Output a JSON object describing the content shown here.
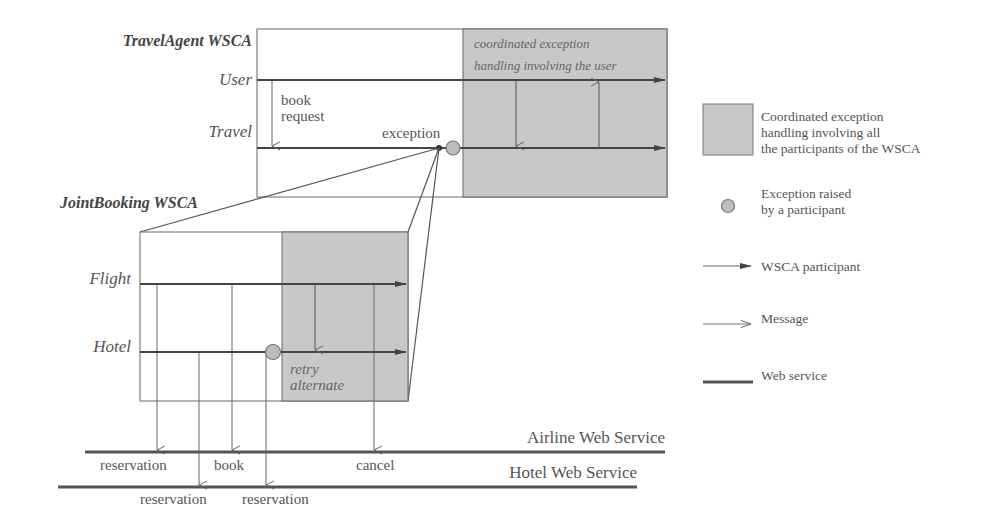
{
  "top_wsca": {
    "title": "TravelAgent WSCA",
    "participants": [
      "User",
      "Travel"
    ],
    "message_label_line1": "book",
    "message_label_line2": "request",
    "exception_label": "exception",
    "shaded_note_line1": "coordinated exception",
    "shaded_note_line2": "handling involving the user"
  },
  "bottom_wsca": {
    "title": "JointBooking WSCA",
    "participants": [
      "Flight",
      "Hotel"
    ],
    "shaded_note_line1": "retry",
    "shaded_note_line2": "alternate"
  },
  "web_services": {
    "airline": "Airline Web Service",
    "hotel": "Hotel Web Service",
    "airline_messages": [
      "reservation",
      "book",
      "cancel"
    ],
    "hotel_messages": [
      "reservation",
      "reservation"
    ]
  },
  "legend": {
    "shaded_line1": "Coordinated exception",
    "shaded_line2": "handling involving all",
    "shaded_line3": "the participants of the WSCA",
    "exception_line1": "Exception raised",
    "exception_line2": "by a participant",
    "participant": "WSCA participant",
    "message": "Message",
    "web_service": "Web service"
  },
  "colors": {
    "shade": "#c8c8c8",
    "line": "#555555",
    "circle": "#bdbdbd"
  }
}
